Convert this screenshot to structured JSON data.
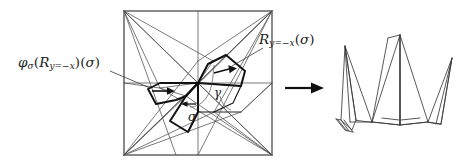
{
  "figure": {
    "background": "#ffffff",
    "ink_color": "#1a1a1a",
    "thin_line_color": "#555555",
    "bold_line_color": "#111111"
  },
  "labels": {
    "phi_leader": {
      "name": "phi-sigma-reflection-sigma",
      "phi": "φ",
      "phi_sub": "σ",
      "open1": "(",
      "R": "R",
      "R_sub": "y=−x",
      "close1": ")",
      "open2": "(",
      "sigma": "σ",
      "close2": ")",
      "plain": "φσ(Ry=−x)(σ)"
    },
    "reflection_leader": {
      "name": "reflection-of-sigma",
      "R": "R",
      "R_sub": "y=−x",
      "open": "(",
      "sigma": "σ",
      "close": ")",
      "plain": "Ry=−x(σ)"
    },
    "sigma_inner": "σ",
    "gamma_inner": "γ"
  },
  "arrow": {
    "name": "folds-into-arrow",
    "direction": "right",
    "meaning": "folds into"
  },
  "crease_pattern": {
    "name": "crease-pattern-square",
    "shape": "square",
    "bounds": {
      "x": 124,
      "y": 11,
      "width": 148,
      "height": 144
    },
    "highlighted_regions": [
      "sigma",
      "R_y=-x(sigma)",
      "phi_sigma(R_y=-x)(sigma)"
    ]
  },
  "folded_model": {
    "name": "folded-crane-base",
    "description": "folded paper crane / flapping bird model"
  }
}
